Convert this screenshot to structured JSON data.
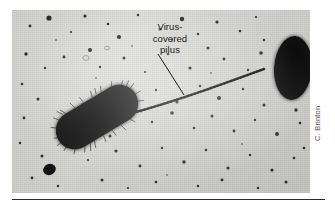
{
  "figure": {
    "kind": "electron-micrograph",
    "background_color": "#d6d6d3",
    "cell_color": "#111111",
    "rule_color": "#2b2b2b"
  },
  "annotation": {
    "label": "Virus-\ncovered\npilus",
    "line1": "Virus-",
    "line2": "covered",
    "line3": "pilus",
    "text_color": "#17171a",
    "leader_line_color": "#1a1a1a"
  },
  "credit": {
    "text": "C. Brinton",
    "color": "#4a4a4a",
    "orientation": "vertical"
  },
  "specimens": [
    {
      "name": "left-bacterium",
      "shape": "rod",
      "surface": "fimbriated"
    },
    {
      "name": "right-bacterium",
      "shape": "oval",
      "surface": "smooth"
    },
    {
      "name": "pilus",
      "shape": "filament",
      "surface": "virus-covered"
    }
  ]
}
